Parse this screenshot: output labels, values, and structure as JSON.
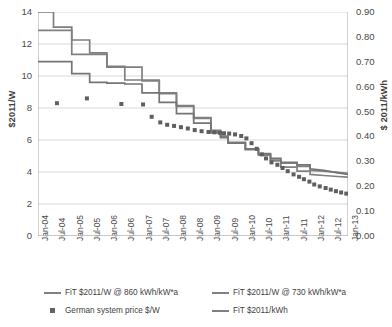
{
  "chart_data": {
    "type": "line",
    "title": "",
    "xlabel": "",
    "ylabel": "$2011/W",
    "ylabel_secondary": "$ 2011/kWh",
    "grid": true,
    "legend_position": "bottom",
    "ylim": [
      0,
      14
    ],
    "ylim_secondary": [
      0.0,
      0.9
    ],
    "y_ticks": [
      "0",
      "2",
      "4",
      "6",
      "8",
      "10",
      "12",
      "14"
    ],
    "y_ticks_secondary": [
      "0.00",
      "0.10",
      "0.20",
      "0.30",
      "0.40",
      "0.50",
      "0.60",
      "0.70",
      "0.80",
      "0.90"
    ],
    "x_ticks": [
      "Jan-04",
      "Jul-04",
      "Jan-05",
      "Jul-05",
      "Jan-06",
      "Jul-06",
      "Jan-07",
      "Jul-07",
      "Jan-08",
      "Jul-08",
      "Jan-09",
      "Jul-09",
      "Jan-10",
      "Jul-10",
      "Jan-11",
      "Jul-11",
      "Jan-12",
      "Jul-12",
      "Jan-13"
    ],
    "x_range": [
      "Jan-04",
      "Jan-13"
    ],
    "colors": {
      "line_fit_860": "#7f7f7f",
      "line_fit_730": "#808080",
      "line_fit_kwh": "#757575",
      "marker_system_price": "#5f5f5f",
      "gridline": "#d9d9d9",
      "axis": "#a6a6a6",
      "text": "#404040"
    },
    "series": [
      {
        "name": "FiT $2011/W @ 860 kWh/kW*a",
        "type": "step",
        "axis": "left",
        "points": [
          [
            0.0,
            14.0
          ],
          [
            0.45,
            14.0
          ],
          [
            0.45,
            13.05
          ],
          [
            0.98,
            13.05
          ],
          [
            0.98,
            12.25
          ],
          [
            1.5,
            12.25
          ],
          [
            1.5,
            11.45
          ],
          [
            2.0,
            11.45
          ],
          [
            2.0,
            10.6
          ],
          [
            2.52,
            10.6
          ],
          [
            2.52,
            10.55
          ],
          [
            3.02,
            10.55
          ],
          [
            3.02,
            9.75
          ],
          [
            3.52,
            9.75
          ],
          [
            3.52,
            8.95
          ],
          [
            4.02,
            8.95
          ],
          [
            4.02,
            8.15
          ],
          [
            4.52,
            8.15
          ],
          [
            4.52,
            7.4
          ],
          [
            5.02,
            7.4
          ],
          [
            5.02,
            6.6
          ],
          [
            5.3,
            6.6
          ],
          [
            5.3,
            6.25
          ],
          [
            5.52,
            6.25
          ],
          [
            5.52,
            5.85
          ],
          [
            6.02,
            5.85
          ],
          [
            6.02,
            5.45
          ],
          [
            6.4,
            5.45
          ],
          [
            6.4,
            5.1
          ],
          [
            6.75,
            5.1
          ],
          [
            6.75,
            4.75
          ],
          [
            7.05,
            4.75
          ],
          [
            7.05,
            4.55
          ],
          [
            7.52,
            4.55
          ],
          [
            7.52,
            4.35
          ],
          [
            7.9,
            4.35
          ],
          [
            7.9,
            4.1
          ],
          [
            8.3,
            4.05
          ],
          [
            8.7,
            3.98
          ],
          [
            9.0,
            3.92
          ]
        ]
      },
      {
        "name": "FiT $2011/W @ 730 kWh/kW*a",
        "type": "step",
        "axis": "left",
        "points": [
          [
            0.0,
            12.85
          ],
          [
            0.45,
            12.85
          ],
          [
            0.45,
            12.85
          ],
          [
            0.98,
            12.85
          ],
          [
            0.98,
            11.35
          ],
          [
            1.5,
            11.35
          ],
          [
            1.5,
            11.35
          ],
          [
            2.0,
            11.35
          ],
          [
            2.0,
            10.55
          ],
          [
            2.52,
            10.55
          ],
          [
            2.52,
            9.75
          ],
          [
            3.02,
            9.75
          ],
          [
            3.02,
            9.7
          ],
          [
            3.52,
            9.7
          ],
          [
            3.52,
            8.9
          ],
          [
            4.02,
            8.9
          ],
          [
            4.02,
            8.1
          ],
          [
            4.52,
            8.1
          ],
          [
            4.52,
            7.35
          ],
          [
            5.02,
            7.35
          ],
          [
            5.02,
            6.55
          ],
          [
            5.3,
            6.55
          ],
          [
            5.3,
            6.2
          ],
          [
            5.52,
            6.2
          ],
          [
            5.52,
            5.8
          ],
          [
            6.02,
            5.8
          ],
          [
            6.02,
            5.4
          ],
          [
            6.4,
            5.4
          ],
          [
            6.4,
            5.05
          ],
          [
            6.75,
            5.05
          ],
          [
            6.75,
            4.7
          ],
          [
            7.05,
            4.7
          ],
          [
            7.05,
            4.3
          ],
          [
            7.52,
            4.3
          ],
          [
            7.52,
            4.05
          ],
          [
            7.9,
            4.05
          ],
          [
            7.9,
            3.85
          ],
          [
            8.3,
            3.78
          ],
          [
            8.7,
            3.72
          ],
          [
            9.0,
            3.68
          ]
        ]
      },
      {
        "name": "FiT $2011/kWh",
        "type": "step",
        "axis": "right",
        "points": [
          [
            0.0,
            10.9
          ],
          [
            0.45,
            10.9
          ],
          [
            0.45,
            10.9
          ],
          [
            0.98,
            10.9
          ],
          [
            0.98,
            10.15
          ],
          [
            1.5,
            10.15
          ],
          [
            1.5,
            9.6
          ],
          [
            2.0,
            9.6
          ],
          [
            2.0,
            9.55
          ],
          [
            2.52,
            9.55
          ],
          [
            2.52,
            9.5
          ],
          [
            3.02,
            9.5
          ],
          [
            3.02,
            8.95
          ],
          [
            3.52,
            8.95
          ],
          [
            3.52,
            8.35
          ],
          [
            4.02,
            8.35
          ],
          [
            4.02,
            7.65
          ],
          [
            4.52,
            7.65
          ],
          [
            4.52,
            7.05
          ],
          [
            5.02,
            7.05
          ],
          [
            5.02,
            6.45
          ],
          [
            5.3,
            6.45
          ],
          [
            5.3,
            6.15
          ],
          [
            5.52,
            6.15
          ],
          [
            5.52,
            5.8
          ],
          [
            6.02,
            5.8
          ],
          [
            6.02,
            5.45
          ],
          [
            6.4,
            5.45
          ],
          [
            6.4,
            5.15
          ],
          [
            6.75,
            5.15
          ],
          [
            6.75,
            4.85
          ],
          [
            7.05,
            4.85
          ],
          [
            7.05,
            4.6
          ],
          [
            7.52,
            4.6
          ],
          [
            7.52,
            4.45
          ],
          [
            7.9,
            4.45
          ],
          [
            7.9,
            4.2
          ],
          [
            8.3,
            4.1
          ],
          [
            8.7,
            3.95
          ],
          [
            9.0,
            3.85
          ]
        ]
      },
      {
        "name": "German system price $/W",
        "type": "scatter",
        "axis": "left",
        "marker": "square",
        "points": [
          [
            0.55,
            8.3
          ],
          [
            1.42,
            8.6
          ],
          [
            2.42,
            8.25
          ],
          [
            3.05,
            8.22
          ],
          [
            3.3,
            7.45
          ],
          [
            3.55,
            7.1
          ],
          [
            3.75,
            6.95
          ],
          [
            3.95,
            6.88
          ],
          [
            4.15,
            6.8
          ],
          [
            4.35,
            6.72
          ],
          [
            4.55,
            6.62
          ],
          [
            4.75,
            6.55
          ],
          [
            4.95,
            6.5
          ],
          [
            5.12,
            6.48
          ],
          [
            5.28,
            6.45
          ],
          [
            5.4,
            6.42
          ],
          [
            5.55,
            6.4
          ],
          [
            5.72,
            6.35
          ],
          [
            5.9,
            6.25
          ],
          [
            6.05,
            6.1
          ],
          [
            6.2,
            5.8
          ],
          [
            6.35,
            5.45
          ],
          [
            6.5,
            5.1
          ],
          [
            6.62,
            4.85
          ],
          [
            6.78,
            4.6
          ],
          [
            6.95,
            4.45
          ],
          [
            7.1,
            4.25
          ],
          [
            7.25,
            4.05
          ],
          [
            7.42,
            3.85
          ],
          [
            7.58,
            3.7
          ],
          [
            7.72,
            3.55
          ],
          [
            7.88,
            3.4
          ],
          [
            8.02,
            3.22
          ],
          [
            8.18,
            3.1
          ],
          [
            8.35,
            3.0
          ],
          [
            8.5,
            2.9
          ],
          [
            8.65,
            2.8
          ],
          [
            8.8,
            2.72
          ],
          [
            8.95,
            2.65
          ]
        ]
      }
    ]
  },
  "legend": {
    "items": [
      {
        "label": "FiT $2011/W @ 860 kWh/kW*a",
        "marker": "line"
      },
      {
        "label": "FiT $2011/W @ 730 kWh/kW*a",
        "marker": "line"
      },
      {
        "label": "German system price $/W",
        "marker": "square"
      },
      {
        "label": "FiT $2011/kWh",
        "marker": "line"
      }
    ]
  }
}
